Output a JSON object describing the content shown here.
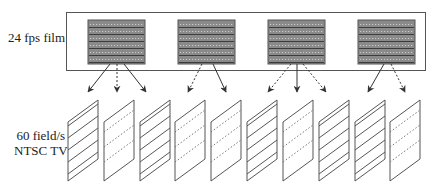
{
  "labels": {
    "film": "24 fps film",
    "tv_line1": "60 field/s",
    "tv_line2": "NTSC TV"
  },
  "colors": {
    "stroke": "#444444",
    "frame_fill": "#8a8a8a",
    "background": "#ffffff"
  },
  "film_frames": [
    {
      "index": 1,
      "pulldown_fields": 3
    },
    {
      "index": 2,
      "pulldown_fields": 2
    },
    {
      "index": 3,
      "pulldown_fields": 3
    },
    {
      "index": 4,
      "pulldown_fields": 2
    }
  ],
  "tv_fields": [
    {
      "index": 1,
      "type": "odd",
      "style": "solid"
    },
    {
      "index": 2,
      "type": "even",
      "style": "dotted"
    },
    {
      "index": 3,
      "type": "odd",
      "style": "solid"
    },
    {
      "index": 4,
      "type": "even",
      "style": "dotted"
    },
    {
      "index": 5,
      "type": "odd",
      "style": "dotted"
    },
    {
      "index": 6,
      "type": "even",
      "style": "solid"
    },
    {
      "index": 7,
      "type": "odd",
      "style": "dotted"
    },
    {
      "index": 8,
      "type": "even",
      "style": "solid"
    },
    {
      "index": 9,
      "type": "odd",
      "style": "solid"
    },
    {
      "index": 10,
      "type": "even",
      "style": "dotted"
    }
  ]
}
